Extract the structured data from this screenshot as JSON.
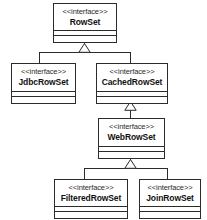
{
  "diagram": {
    "type": "uml-class-diagram",
    "stereotype_label": "<<interface>>",
    "line_color": "#2b2b2b",
    "fill_color": "#ffffff",
    "nodes": [
      {
        "id": "rowset",
        "stereotype": "<<interface>>",
        "name": "RowSet"
      },
      {
        "id": "jdbcrowset",
        "stereotype": "<<interface>>",
        "name": "JdbcRowSet"
      },
      {
        "id": "cachedrowset",
        "stereotype": "<<interface>>",
        "name": "CachedRowSet"
      },
      {
        "id": "webrowset",
        "stereotype": "<<interface>>",
        "name": "WebRowSet"
      },
      {
        "id": "filteredrowset",
        "stereotype": "<<interface>>",
        "name": "FilteredRowSet"
      },
      {
        "id": "joinrowset",
        "stereotype": "<<interface>>",
        "name": "JoinRowSet"
      }
    ],
    "edges": [
      {
        "from": "jdbcrowset",
        "to": "rowset",
        "kind": "generalization"
      },
      {
        "from": "cachedrowset",
        "to": "rowset",
        "kind": "generalization"
      },
      {
        "from": "webrowset",
        "to": "cachedrowset",
        "kind": "generalization"
      },
      {
        "from": "filteredrowset",
        "to": "webrowset",
        "kind": "generalization"
      },
      {
        "from": "joinrowset",
        "to": "webrowset",
        "kind": "generalization"
      }
    ]
  }
}
